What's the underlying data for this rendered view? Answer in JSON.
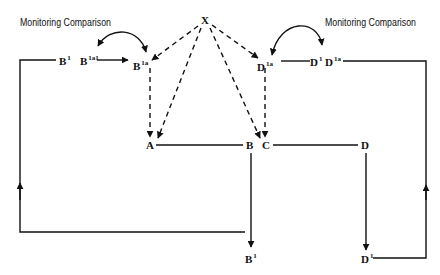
{
  "diagram": {
    "annotations": {
      "left": "Monitoring Comparison",
      "right": "Monitoring Comparison"
    },
    "nodes": {
      "X": {
        "base": "X",
        "sup": ""
      },
      "B1_top": {
        "base": "B",
        "sup": "1"
      },
      "B1a1": {
        "base": "B",
        "sup": "1a1"
      },
      "B1a": {
        "base": "B",
        "sup": "1a"
      },
      "D1a_left": {
        "base": "D",
        "sup": "1a"
      },
      "D1_top": {
        "base": "D",
        "sup": "1"
      },
      "D1a_right": {
        "base": "D",
        "sup": "1a"
      },
      "A": {
        "base": "A",
        "sup": ""
      },
      "B": {
        "base": "B",
        "sup": ""
      },
      "C": {
        "base": "C",
        "sup": ""
      },
      "D": {
        "base": "D",
        "sup": ""
      },
      "B1_bottom": {
        "base": "B",
        "sup": "1"
      },
      "D1_bottom": {
        "base": "D",
        "sup": "1"
      }
    },
    "colors": {
      "line": "#111111",
      "background": "#ffffff"
    }
  }
}
